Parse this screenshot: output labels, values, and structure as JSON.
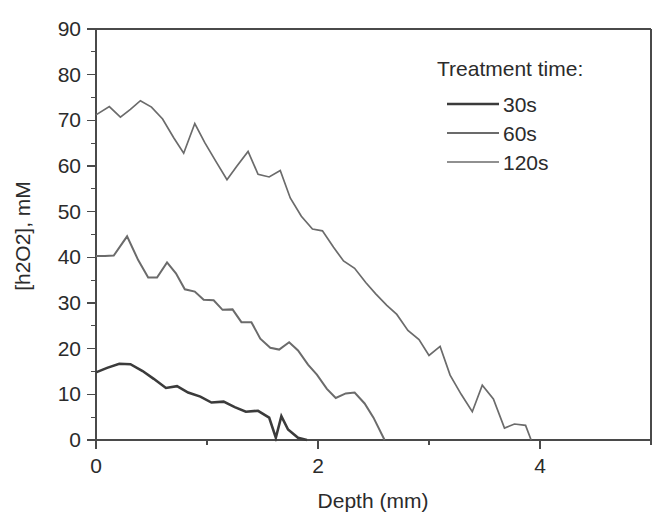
{
  "chart_data": {
    "type": "line",
    "title": "",
    "xlabel": "Depth (mm)",
    "ylabel": "[h2O2], mM",
    "xlim": [
      0,
      5
    ],
    "ylim": [
      0,
      90
    ],
    "grid": false,
    "x_ticks_major": [
      0,
      2,
      4
    ],
    "x_ticks_minor": [
      1,
      3,
      5
    ],
    "x_tick_labels": [
      "0",
      "2",
      "4"
    ],
    "y_ticks_major": [
      0,
      10,
      20,
      30,
      40,
      50,
      60,
      70,
      80,
      90
    ],
    "y_ticks_minor": [
      5,
      15,
      25,
      35,
      45,
      55,
      65,
      75,
      85
    ],
    "y_tick_labels": [
      "0",
      "10",
      "20",
      "30",
      "40",
      "50",
      "60",
      "70",
      "80",
      "90"
    ],
    "legend_title": "Treatment time:",
    "legend_position": "top-right",
    "series": [
      {
        "name": "30s",
        "color": "#3b3b3b",
        "width": 2.6,
        "x": [
          0.0,
          0.1,
          0.21,
          0.31,
          0.42,
          0.52,
          0.63,
          0.73,
          0.83,
          0.94,
          1.04,
          1.15,
          1.25,
          1.35,
          1.46,
          1.56,
          1.62,
          1.67,
          1.73,
          1.82,
          1.9
        ],
        "y": [
          14.8,
          15.8,
          16.7,
          16.6,
          15.1,
          13.4,
          11.4,
          11.8,
          10.4,
          9.5,
          8.2,
          8.4,
          7.2,
          6.2,
          6.4,
          4.9,
          0.5,
          5.2,
          2.3,
          0.5,
          0.0
        ]
      },
      {
        "name": "60s",
        "color": "#6b6b6b",
        "width": 2.0,
        "x": [
          0.0,
          0.08,
          0.16,
          0.28,
          0.38,
          0.47,
          0.55,
          0.64,
          0.72,
          0.8,
          0.89,
          0.97,
          1.06,
          1.14,
          1.23,
          1.31,
          1.4,
          1.48,
          1.57,
          1.65,
          1.74,
          1.82,
          1.91,
          1.99,
          2.08,
          2.16,
          2.25,
          2.33,
          2.42,
          2.5,
          2.6
        ],
        "y": [
          40.3,
          40.3,
          40.4,
          44.6,
          39.4,
          35.6,
          35.6,
          38.9,
          36.5,
          33.0,
          32.5,
          30.7,
          30.6,
          28.5,
          28.6,
          25.8,
          25.8,
          22.2,
          20.2,
          19.8,
          21.4,
          19.6,
          16.5,
          14.3,
          11.2,
          9.2,
          10.2,
          10.4,
          8.0,
          4.9,
          0.0
        ]
      },
      {
        "name": "120s",
        "color": "#6b6b6b",
        "width": 1.7,
        "x": [
          0.0,
          0.12,
          0.22,
          0.31,
          0.4,
          0.5,
          0.6,
          0.7,
          0.79,
          0.89,
          0.98,
          1.08,
          1.18,
          1.27,
          1.37,
          1.46,
          1.56,
          1.66,
          1.75,
          1.85,
          1.95,
          2.04,
          2.14,
          2.23,
          2.33,
          2.43,
          2.52,
          2.62,
          2.71,
          2.81,
          2.91,
          3.0,
          3.1,
          3.19,
          3.29,
          3.39,
          3.48,
          3.58,
          3.68,
          3.77,
          3.87,
          3.92
        ],
        "y": [
          71.2,
          73.0,
          70.7,
          72.4,
          74.3,
          72.9,
          70.3,
          66.2,
          62.8,
          69.3,
          65.1,
          61.0,
          57.0,
          60.0,
          63.2,
          58.2,
          57.6,
          59.0,
          53.0,
          49.0,
          46.2,
          45.8,
          42.2,
          39.2,
          37.6,
          34.5,
          32.0,
          29.5,
          27.5,
          24.0,
          22.0,
          18.5,
          20.5,
          14.2,
          10.0,
          6.2,
          12.0,
          9.0,
          2.6,
          3.5,
          3.2,
          0.0
        ]
      }
    ]
  },
  "legend": {
    "title": "Treatment time:",
    "entries": [
      {
        "label": "30s"
      },
      {
        "label": "60s"
      },
      {
        "label": "120s"
      }
    ]
  },
  "axes": {
    "x_title": "Depth (mm)",
    "y_title": "[h2O2], mM"
  }
}
